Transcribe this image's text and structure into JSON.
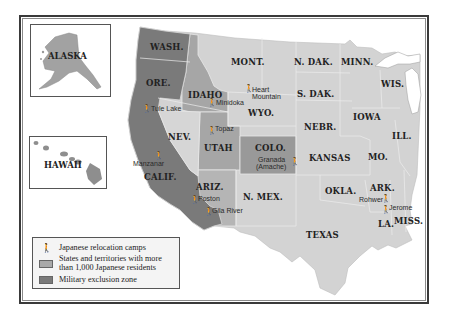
{
  "map": {
    "insets": {
      "alaska_label": "ALASKA",
      "hawaii_label": "HAWAII"
    },
    "states": [
      {
        "label": "WASH.",
        "x": 150,
        "y": 50
      },
      {
        "label": "ORE.",
        "x": 146,
        "y": 86
      },
      {
        "label": "IDAHO",
        "x": 188,
        "y": 94
      },
      {
        "label": "MONT.",
        "x": 231,
        "y": 65
      },
      {
        "label": "N. DAK.",
        "x": 294,
        "y": 65
      },
      {
        "label": "MINN.",
        "x": 341,
        "y": 65
      },
      {
        "label": "WIS.",
        "x": 385,
        "y": 87
      },
      {
        "label": "S. DAK.",
        "x": 297,
        "y": 97
      },
      {
        "label": "WYO.",
        "x": 259,
        "y": 116
      },
      {
        "label": "IOWA",
        "x": 364,
        "y": 120
      },
      {
        "label": "NEBR.",
        "x": 306,
        "y": 130
      },
      {
        "label": "ILL.",
        "x": 402,
        "y": 139
      },
      {
        "label": "NEV.",
        "x": 176,
        "y": 140
      },
      {
        "label": "UTAH",
        "x": 213,
        "y": 151
      },
      {
        "label": "COLO.",
        "x": 257,
        "y": 151
      },
      {
        "label": "KANSAS",
        "x": 309,
        "y": 161
      },
      {
        "label": "MO.",
        "x": 368,
        "y": 160
      },
      {
        "label": "CALIF.",
        "x": 144,
        "y": 180
      },
      {
        "label": "ARIZ.",
        "x": 203,
        "y": 190
      },
      {
        "label": "N. MEX.",
        "x": 245,
        "y": 200
      },
      {
        "label": "OKLA.",
        "x": 327,
        "y": 194
      },
      {
        "label": "ARK.",
        "x": 377,
        "y": 191
      },
      {
        "label": "MISS.",
        "x": 398,
        "y": 224
      },
      {
        "label": "LA.",
        "x": 382,
        "y": 228
      },
      {
        "label": "TEXAS",
        "x": 307,
        "y": 238
      }
    ],
    "camps": [
      {
        "name": "Tule Lake",
        "x": 146,
        "y": 107
      },
      {
        "name": "Minidoka",
        "x": 214,
        "y": 104
      },
      {
        "name": "Heart",
        "name2": "Mountain",
        "x": 247,
        "y": 89
      },
      {
        "name": "Topaz",
        "x": 213,
        "y": 132
      },
      {
        "name": "Manzanar",
        "x": 140,
        "y": 162
      },
      {
        "name": "Granada",
        "name2": "(Amache)",
        "x": 258,
        "y": 161
      },
      {
        "name": "Poston",
        "x": 196,
        "y": 200
      },
      {
        "name": "Gila River",
        "x": 211,
        "y": 212
      },
      {
        "name": "Rohwer",
        "x": 384,
        "y": 199
      },
      {
        "name": "Jerome",
        "x": 387,
        "y": 208
      }
    ],
    "colors": {
      "exclusion_zone": "#7c7c7c",
      "japanese_residents": "#a9a9a9",
      "other_states": "#d4d4d4",
      "lakes_water": "#ffffff",
      "border": "#f0f0f0"
    }
  },
  "legend": {
    "items": [
      {
        "icon": "camp-icon",
        "glyph": "🚶",
        "label": "Japanese relocation camps"
      },
      {
        "icon": "swatch-residents",
        "label_line1": "States and territories with more",
        "label_line2": "than 1,000 Japanese residents"
      },
      {
        "icon": "swatch-exclusion",
        "label": "Military exclusion zone"
      }
    ]
  }
}
